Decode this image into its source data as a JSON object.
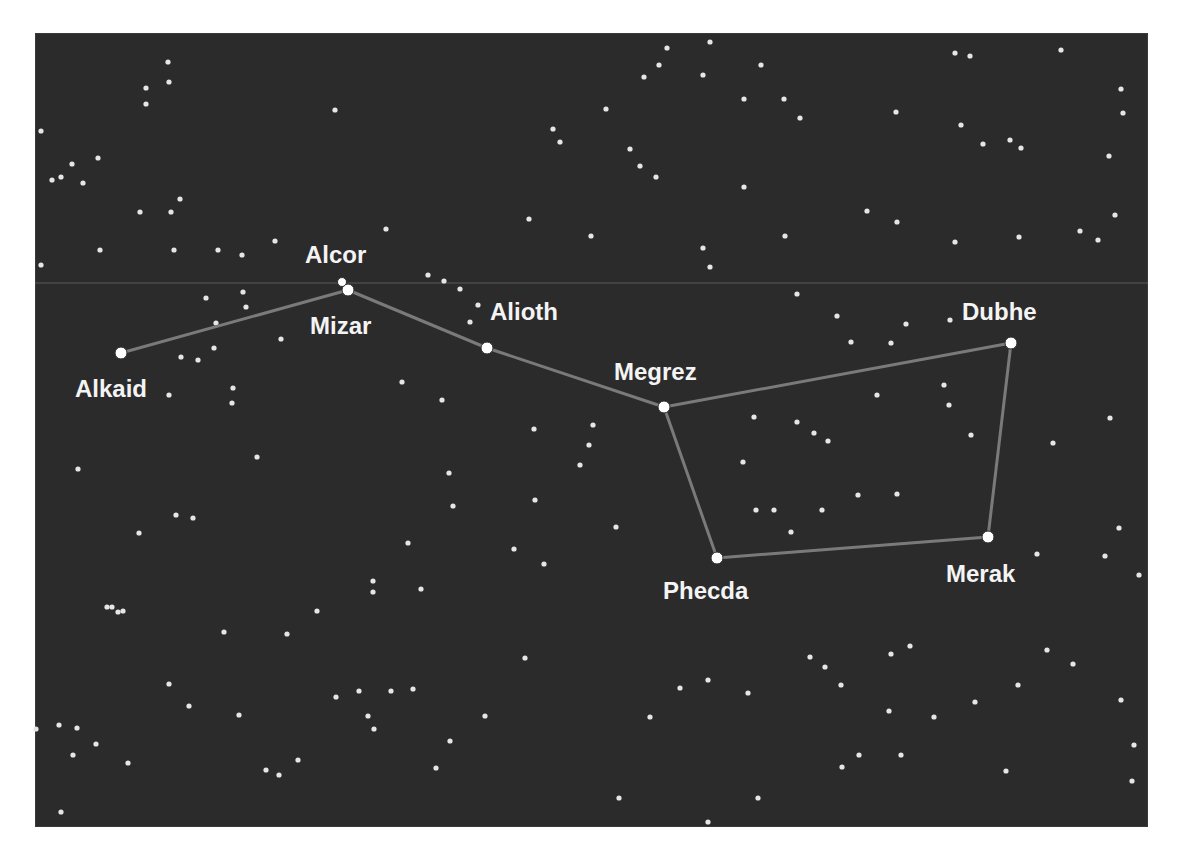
{
  "figure": {
    "colors": {
      "page_background": "#ffffff",
      "sky_background": "#2b2b2b",
      "star": "#e6e6e6",
      "named_star": "#ffffff",
      "connector_line": "#7a7a7a",
      "label": "#f4f4f4",
      "horizon_line": "#5a5a5a"
    },
    "panel": {
      "x": 35,
      "y": 33,
      "width": 1113,
      "height": 794
    },
    "horizon_line_y": 283,
    "named_stars": [
      {
        "name": "Alkaid",
        "x": 121,
        "y": 353,
        "label_x": 75,
        "label_y": 397
      },
      {
        "name": "Mizar",
        "x": 348,
        "y": 290,
        "label_x": 310,
        "label_y": 334
      },
      {
        "name": "Alcor",
        "x": 342,
        "y": 282,
        "label_x": 305,
        "label_y": 263
      },
      {
        "name": "Alioth",
        "x": 487,
        "y": 348,
        "label_x": 490,
        "label_y": 320
      },
      {
        "name": "Megrez",
        "x": 664,
        "y": 407,
        "label_x": 614,
        "label_y": 380
      },
      {
        "name": "Dubhe",
        "x": 1011,
        "y": 343,
        "label_x": 962,
        "label_y": 320
      },
      {
        "name": "Merak",
        "x": 988,
        "y": 537,
        "label_x": 946,
        "label_y": 582
      },
      {
        "name": "Phecda",
        "x": 717,
        "y": 558,
        "label_x": 663,
        "label_y": 599
      }
    ],
    "connections": [
      [
        "Alkaid",
        "Mizar"
      ],
      [
        "Mizar",
        "Alioth"
      ],
      [
        "Alioth",
        "Megrez"
      ],
      [
        "Megrez",
        "Dubhe"
      ],
      [
        "Dubhe",
        "Merak"
      ],
      [
        "Merak",
        "Phecda"
      ],
      [
        "Phecda",
        "Megrez"
      ]
    ],
    "background_stars": [
      [
        168,
        62
      ],
      [
        169,
        82
      ],
      [
        146,
        88
      ],
      [
        146,
        104
      ],
      [
        335,
        110
      ],
      [
        41,
        131
      ],
      [
        98,
        158
      ],
      [
        72,
        164
      ],
      [
        61,
        177
      ],
      [
        52,
        180
      ],
      [
        83,
        183
      ],
      [
        171,
        212
      ],
      [
        180,
        199
      ],
      [
        140,
        212
      ],
      [
        218,
        250
      ],
      [
        100,
        250
      ],
      [
        174,
        250
      ],
      [
        275,
        241
      ],
      [
        386,
        229
      ],
      [
        41,
        265
      ],
      [
        242,
        255
      ],
      [
        710,
        42
      ],
      [
        667,
        48
      ],
      [
        659,
        65
      ],
      [
        644,
        77
      ],
      [
        703,
        75
      ],
      [
        761,
        65
      ],
      [
        744,
        99
      ],
      [
        606,
        109
      ],
      [
        553,
        129
      ],
      [
        560,
        142
      ],
      [
        630,
        149
      ],
      [
        640,
        166
      ],
      [
        656,
        177
      ],
      [
        744,
        187
      ],
      [
        529,
        219
      ],
      [
        591,
        236
      ],
      [
        703,
        248
      ],
      [
        710,
        267
      ],
      [
        428,
        275
      ],
      [
        444,
        281
      ],
      [
        955,
        53
      ],
      [
        970,
        56
      ],
      [
        1061,
        50
      ],
      [
        1121,
        89
      ],
      [
        1123,
        113
      ],
      [
        784,
        99
      ],
      [
        800,
        118
      ],
      [
        896,
        112
      ],
      [
        961,
        125
      ],
      [
        983,
        144
      ],
      [
        1010,
        140
      ],
      [
        1021,
        148
      ],
      [
        1109,
        156
      ],
      [
        867,
        211
      ],
      [
        897,
        222
      ],
      [
        785,
        236
      ],
      [
        955,
        242
      ],
      [
        1019,
        237
      ],
      [
        1080,
        231
      ],
      [
        1098,
        240
      ],
      [
        1115,
        215
      ],
      [
        206,
        298
      ],
      [
        243,
        292
      ],
      [
        246,
        307
      ],
      [
        216,
        323
      ],
      [
        281,
        339
      ],
      [
        214,
        348
      ],
      [
        181,
        357
      ],
      [
        198,
        360
      ],
      [
        233,
        388
      ],
      [
        232,
        403
      ],
      [
        169,
        395
      ],
      [
        460,
        289
      ],
      [
        478,
        305
      ],
      [
        470,
        322
      ],
      [
        797,
        294
      ],
      [
        837,
        316
      ],
      [
        906,
        324
      ],
      [
        950,
        320
      ],
      [
        851,
        342
      ],
      [
        891,
        343
      ],
      [
        402,
        382
      ],
      [
        442,
        400
      ],
      [
        534,
        429
      ],
      [
        593,
        425
      ],
      [
        589,
        445
      ],
      [
        580,
        465
      ],
      [
        449,
        473
      ],
      [
        453,
        506
      ],
      [
        535,
        500
      ],
      [
        616,
        527
      ],
      [
        408,
        543
      ],
      [
        514,
        549
      ],
      [
        544,
        564
      ],
      [
        421,
        589
      ],
      [
        257,
        457
      ],
      [
        78,
        469
      ],
      [
        176,
        515
      ],
      [
        193,
        518
      ],
      [
        139,
        533
      ],
      [
        373,
        581
      ],
      [
        373,
        592
      ],
      [
        112,
        607
      ],
      [
        123,
        611
      ],
      [
        317,
        611
      ],
      [
        877,
        395
      ],
      [
        944,
        385
      ],
      [
        949,
        405
      ],
      [
        754,
        417
      ],
      [
        797,
        422
      ],
      [
        814,
        433
      ],
      [
        828,
        441
      ],
      [
        971,
        435
      ],
      [
        743,
        462
      ],
      [
        1053,
        443
      ],
      [
        1110,
        418
      ],
      [
        858,
        495
      ],
      [
        897,
        494
      ],
      [
        756,
        510
      ],
      [
        774,
        510
      ],
      [
        822,
        510
      ],
      [
        791,
        532
      ],
      [
        1119,
        528
      ],
      [
        1037,
        554
      ],
      [
        1105,
        556
      ],
      [
        1139,
        575
      ],
      [
        107,
        607
      ],
      [
        118,
        612
      ],
      [
        224,
        632
      ],
      [
        287,
        634
      ],
      [
        525,
        658
      ],
      [
        169,
        684
      ],
      [
        189,
        706
      ],
      [
        239,
        715
      ],
      [
        336,
        697
      ],
      [
        359,
        691
      ],
      [
        391,
        691
      ],
      [
        368,
        716
      ],
      [
        374,
        729
      ],
      [
        413,
        689
      ],
      [
        485,
        716
      ],
      [
        450,
        741
      ],
      [
        36,
        729
      ],
      [
        59,
        725
      ],
      [
        77,
        728
      ],
      [
        96,
        744
      ],
      [
        73,
        755
      ],
      [
        128,
        763
      ],
      [
        298,
        760
      ],
      [
        266,
        770
      ],
      [
        279,
        775
      ],
      [
        436,
        768
      ],
      [
        61,
        812
      ],
      [
        910,
        646
      ],
      [
        891,
        654
      ],
      [
        1047,
        650
      ],
      [
        1073,
        664
      ],
      [
        810,
        657
      ],
      [
        825,
        667
      ],
      [
        841,
        685
      ],
      [
        1018,
        685
      ],
      [
        680,
        688
      ],
      [
        708,
        680
      ],
      [
        748,
        693
      ],
      [
        650,
        717
      ],
      [
        889,
        711
      ],
      [
        975,
        702
      ],
      [
        934,
        717
      ],
      [
        1134,
        745
      ],
      [
        859,
        755
      ],
      [
        901,
        755
      ],
      [
        842,
        767
      ],
      [
        1006,
        771
      ],
      [
        1132,
        781
      ],
      [
        619,
        798
      ],
      [
        758,
        798
      ],
      [
        708,
        822
      ],
      [
        1121,
        700
      ]
    ]
  }
}
